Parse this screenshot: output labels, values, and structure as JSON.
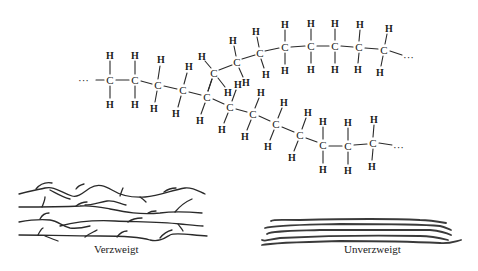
{
  "diagram": {
    "atom_labels": {
      "carbon": "C",
      "hydrogen": "H",
      "chain_continuation": "···"
    },
    "molecule": {
      "main_chain_carbons": [
        [
          110,
          80
        ],
        [
          135,
          80
        ],
        [
          158,
          85
        ],
        [
          183,
          90
        ],
        [
          207,
          97
        ],
        [
          230,
          107
        ],
        [
          253,
          114
        ],
        [
          276,
          124
        ],
        [
          300,
          135
        ],
        [
          323,
          145
        ],
        [
          348,
          146
        ],
        [
          373,
          143
        ]
      ],
      "branch_carbons": [
        [
          214,
          73
        ],
        [
          237,
          62
        ],
        [
          260,
          53
        ],
        [
          285,
          47
        ],
        [
          311,
          46
        ],
        [
          335,
          46
        ],
        [
          359,
          47
        ],
        [
          384,
          50
        ]
      ],
      "branch_point_index": 4
    },
    "schematics": [
      {
        "label": "Verzweigt",
        "type": "branched"
      },
      {
        "label": "Unverzweigt",
        "type": "unbranched"
      }
    ]
  }
}
